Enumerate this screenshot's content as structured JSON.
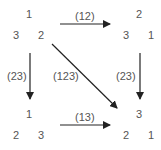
{
  "nodes": {
    "top_left": {
      "top": "1",
      "left": "3",
      "right": "2"
    },
    "top_right": {
      "top": "2",
      "left": "3",
      "right": "1"
    },
    "bottom_left": {
      "top": "1",
      "left": "2",
      "right": "3"
    },
    "bottom_right": {
      "top": "3",
      "left": "2",
      "right": "1"
    }
  },
  "edges": {
    "top": "(12)",
    "left": "(23)",
    "diagonal": "(123)",
    "right": "(23)",
    "bottom": "(13)"
  }
}
